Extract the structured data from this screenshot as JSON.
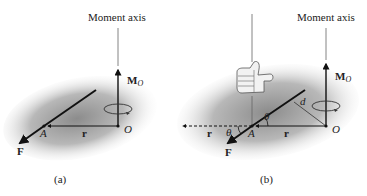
{
  "figure": {
    "panels": [
      {
        "id": "a",
        "caption": "(a)",
        "moment_axis_label": "Moment axis",
        "moment_label_main": "M",
        "moment_label_sub": "O",
        "point_A": "A",
        "point_O": "O",
        "vector_r": "r",
        "force_F": "F"
      },
      {
        "id": "b",
        "caption": "(b)",
        "moment_axis_label": "Moment axis",
        "moment_label_main": "M",
        "moment_label_sub": "O",
        "point_A": "A",
        "point_O": "O",
        "vector_r": "r",
        "vector_r_extended": "r",
        "force_F": "F",
        "angle_theta_1": "θ",
        "angle_theta_2": "θ",
        "distance_d": "d",
        "hand_icon": "thumbs-up-right-hand-rule"
      }
    ],
    "colors": {
      "shading": "#9a9a9a",
      "line": "#111111",
      "axis": "#555555"
    }
  }
}
